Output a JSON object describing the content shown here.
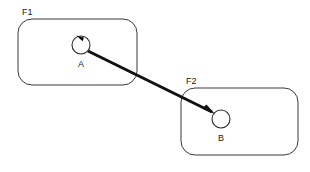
{
  "figure": {
    "background_color": "#ffffff",
    "stroke_color": "#3a3a3a",
    "arrow_color": "#111111",
    "text_color": "#1a1a1a",
    "width": 310,
    "height": 172
  },
  "frames": [
    {
      "id": "F1",
      "label": "F1",
      "label_x": 22,
      "label_y": 15,
      "x": 18,
      "y": 19,
      "width": 119,
      "height": 66,
      "corner_radius": 14
    },
    {
      "id": "F2",
      "label": "F2",
      "label_x": 186,
      "label_y": 84,
      "x": 181,
      "y": 88,
      "width": 117,
      "height": 67,
      "corner_radius": 14
    }
  ],
  "nodes": [
    {
      "id": "A",
      "label": "A",
      "cx": 81,
      "cy": 45,
      "r": 9,
      "label_x": 81,
      "label_y": 67,
      "has_self_loop": true,
      "self_loop_direction": "counterclockwise"
    },
    {
      "id": "B",
      "label": "B",
      "cx": 221,
      "cy": 119,
      "r": 9,
      "label_x": 221,
      "label_y": 141,
      "has_self_loop": false
    }
  ],
  "edges": [
    {
      "id": "A-to-B",
      "from": "A",
      "to": "B",
      "x1": 88,
      "y1": 51,
      "x2": 214,
      "y2": 113,
      "arrowhead": "filled-triangle",
      "width": 3
    }
  ],
  "self_loops": [
    {
      "id": "A-self-loop",
      "node": "A",
      "arrowhead_at": "top",
      "arrowhead_direction": "left"
    }
  ]
}
